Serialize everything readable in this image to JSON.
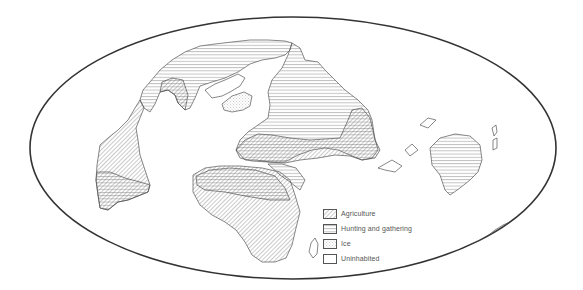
{
  "map": {
    "title": "World subsistence patterns map (oblique elliptical projection)",
    "projection_outline": {
      "cx": 293,
      "cy": 148,
      "rx": 263,
      "ry": 131
    },
    "colors": {
      "outline": "#333333",
      "coast": "#555555",
      "hatch": "#7a7a7a",
      "background": "#ffffff"
    },
    "regions": [
      {
        "name": "north-america",
        "category": "mixed"
      },
      {
        "name": "south-america-west",
        "category": "mixed"
      },
      {
        "name": "greenland",
        "category": "ice"
      },
      {
        "name": "eurasia",
        "category": "mixed"
      },
      {
        "name": "africa",
        "category": "mixed"
      },
      {
        "name": "arabia",
        "category": "hunting"
      },
      {
        "name": "australia",
        "category": "hunting"
      },
      {
        "name": "antarctica",
        "category": "ice"
      },
      {
        "name": "madagascar",
        "category": "uninhabited"
      },
      {
        "name": "new-zealand",
        "category": "uninhabited"
      }
    ]
  },
  "legend": {
    "items": [
      {
        "label": "Agriculture",
        "pattern": "diagonal"
      },
      {
        "label": "Hunting and gathering",
        "pattern": "horizontal"
      },
      {
        "label": "Ice",
        "pattern": "dots"
      },
      {
        "label": "Uninhabited",
        "pattern": "blank"
      }
    ]
  }
}
